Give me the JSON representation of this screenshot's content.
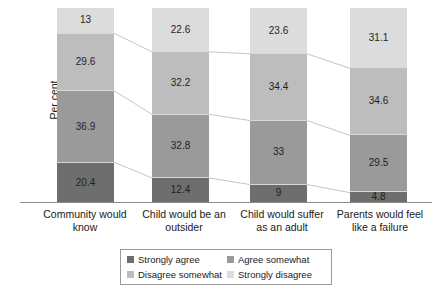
{
  "chart_data": {
    "type": "bar",
    "stacked": true,
    "stack_mode": "percent",
    "title": "",
    "subtitle": "",
    "xlabel": "",
    "ylabel": "Per cent",
    "ylim": [
      0,
      100
    ],
    "grid": false,
    "legend_position": "bottom",
    "annotations": "Thin grey connector lines join equivalent segment boundaries across adjacent bars.",
    "categories": [
      "Community would know",
      "Child would be an outsider",
      "Child would suffer as an adult",
      "Parents would feel like a failure"
    ],
    "category_lines": [
      [
        "Community would",
        "know"
      ],
      [
        "Child would be an",
        "outsider"
      ],
      [
        "Child would suffer",
        "as an adult"
      ],
      [
        "Parents would feel",
        "like a failure"
      ]
    ],
    "series": [
      {
        "name": "Strongly agree",
        "color": "#6e6e6e",
        "values": [
          20.4,
          12.4,
          9,
          4.8
        ]
      },
      {
        "name": "Agree somewhat",
        "color": "#9a9a9a",
        "values": [
          36.9,
          32.8,
          33,
          29.5
        ]
      },
      {
        "name": "Disagree somewhat",
        "color": "#bdbdbd",
        "values": [
          29.6,
          32.2,
          34.4,
          34.6
        ]
      },
      {
        "name": "Strongly disagree",
        "color": "#dcdcdc",
        "values": [
          13,
          22.6,
          23.6,
          31.1
        ]
      }
    ],
    "value_labels": {
      "bar_1": [
        "20.4",
        "36.9",
        "29.6",
        "13"
      ],
      "bar_2": [
        "12.4",
        "32.8",
        "32.2",
        "22.6"
      ],
      "bar_3": [
        "9",
        "33",
        "34.4",
        "23.6"
      ],
      "bar_4": [
        "4.8",
        "29.5",
        "34.6",
        "31.1"
      ]
    }
  },
  "legend": {
    "items": [
      {
        "label": "Strongly agree",
        "color": "#6e6e6e"
      },
      {
        "label": "Agree somewhat",
        "color": "#9a9a9a"
      },
      {
        "label": "Disagree somewhat",
        "color": "#bdbdbd"
      },
      {
        "label": "Strongly disagree",
        "color": "#dcdcdc"
      }
    ]
  }
}
